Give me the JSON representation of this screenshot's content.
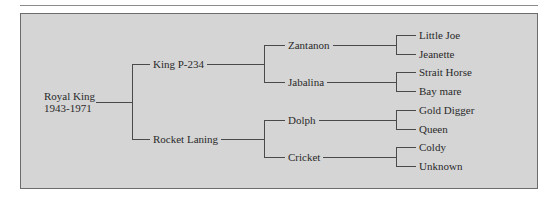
{
  "diagram": {
    "type": "pedigree-tree",
    "root": {
      "name": "Royal King",
      "years": "1943-1971"
    },
    "generation1": {
      "sire": "King P-234",
      "dam": "Rocket Laning"
    },
    "generation2": {
      "sire_sire": "Zantanon",
      "sire_dam": "Jabalina",
      "dam_sire": "Dolph",
      "dam_dam": "Cricket"
    },
    "generation3": {
      "zantanon_sire": "Little Joe",
      "zantanon_dam": "Jeanette",
      "jabalina_sire": "Strait Horse",
      "jabalina_dam": "Bay mare",
      "dolph_sire": "Gold Digger",
      "dolph_dam": "Queen",
      "cricket_sire": "Coldy",
      "cricket_dam": "Unknown"
    },
    "colors": {
      "panel_background": "#d5d5d5",
      "panel_border": "#6c6c6c",
      "lines": "#4a4a4a",
      "text": "#2a2a2a"
    }
  }
}
